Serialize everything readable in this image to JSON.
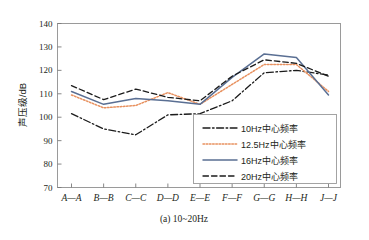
{
  "figure": {
    "caption": "(a) 10~20Hz",
    "ylabel": "声压级/dB",
    "background": "#ffffff",
    "frame_color": "#9a9a9a"
  },
  "chart_data": {
    "type": "line",
    "title": "",
    "subtitle": "",
    "caption": "(a) 10~20Hz",
    "xlabel": "",
    "ylabel": "声压级/dB",
    "ylim": [
      70,
      140
    ],
    "ytick_step": 10,
    "yticks": [
      "70",
      "80",
      "90",
      "100",
      "110",
      "120",
      "130",
      "140"
    ],
    "grid": false,
    "legend_position": "center-right-inside",
    "categories": [
      "A—A",
      "B—B",
      "C—C",
      "D—D",
      "E—E",
      "F—F",
      "G—G",
      "H—H",
      "J—J"
    ],
    "series": [
      {
        "name": "10Hz中心频率",
        "color": "#1b1b1b",
        "style": "dashdot",
        "values": [
          101.5,
          95.0,
          92.5,
          101.0,
          101.5,
          107.0,
          119.0,
          120.0,
          118.0
        ]
      },
      {
        "name": "12.5Hz中心频率",
        "color": "#e8915f",
        "style": "dotted",
        "values": [
          109.5,
          104.0,
          105.0,
          110.5,
          105.5,
          114.0,
          122.5,
          122.5,
          111.0
        ]
      },
      {
        "name": "16Hz中心频率",
        "color": "#5a6f93",
        "style": "solid",
        "values": [
          111.0,
          105.5,
          108.0,
          107.0,
          105.5,
          117.0,
          127.0,
          125.5,
          109.5
        ]
      },
      {
        "name": "20Hz中心频率",
        "color": "#1b1b1b",
        "style": "dashed",
        "values": [
          113.5,
          107.5,
          112.0,
          108.5,
          107.0,
          117.5,
          124.5,
          123.0,
          117.5
        ]
      }
    ]
  },
  "legend": {
    "items": [
      {
        "label": "10Hz中心频率"
      },
      {
        "label": "12.5Hz中心频率"
      },
      {
        "label": "16Hz中心频率"
      },
      {
        "label": "20Hz中心频率"
      }
    ]
  }
}
